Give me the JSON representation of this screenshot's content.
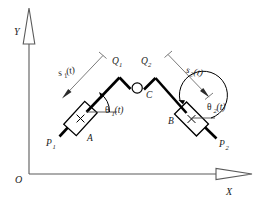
{
  "figure": {
    "background_color": "#ffffff",
    "ink_color": "#000000",
    "axis_color": "#5a5a5a"
  },
  "axes": {
    "origin_label": "O",
    "x_label": "X",
    "y_label": "Y",
    "x_arrow_icon": "hollow-triangle-right",
    "y_arrow_icon": "hollow-triangle-up"
  },
  "joints": {
    "q1_label": "Q",
    "q1_sub": "1",
    "q2_label": "Q",
    "q2_sub": "2",
    "c_label": "C",
    "c_icon": "revolute-joint-circle"
  },
  "sliders": [
    {
      "name": "A",
      "label": "A",
      "cross_icon": "slider-cross-mark",
      "rod_end_label": "P",
      "rod_end_sub": "1"
    },
    {
      "name": "B",
      "label": "B",
      "cross_icon": "slider-cross-mark",
      "rod_end_label": "P",
      "rod_end_sub": "2"
    }
  ],
  "dimensions": [
    {
      "label": "s",
      "sub": "1",
      "suffix": "(t)",
      "full": "s1(t)",
      "side": "left"
    },
    {
      "label": "s",
      "sub": "2",
      "suffix": "(t)",
      "full": "s2(t)",
      "side": "right"
    }
  ],
  "angles": [
    {
      "symbol": "θ",
      "sub": "1",
      "suffix": "(t)",
      "full": "θ1(t)",
      "at": "A"
    },
    {
      "symbol": "θ",
      "sub": "2",
      "suffix": "(t)",
      "full": "θ2(t)",
      "at": "B"
    }
  ]
}
